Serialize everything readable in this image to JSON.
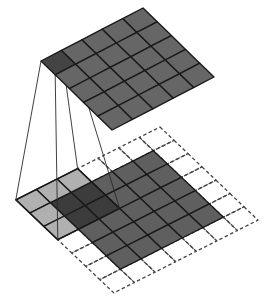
{
  "diagram": {
    "type": "convolution-illustration",
    "colors": {
      "background": "#ffffff",
      "output_cell": "#666666",
      "output_active_cell": "#444444",
      "input_cell": "#5f5f5f",
      "kernel_cell": "#b0b0b0",
      "kernel_overlap_cell": "#3c3c3c",
      "grid_line": "#1a1a1a",
      "padding_dash": "#444444",
      "projection_line": "#2a2a2a"
    },
    "output_grid": {
      "rows": 5,
      "cols": 5,
      "origin": [
        143,
        8
      ],
      "u": [
        14.2,
        13.8
      ],
      "v": [
        -20.4,
        10.6
      ],
      "active_cell": {
        "u": 0,
        "v": 4
      }
    },
    "padded_grid": {
      "rows": 7,
      "cols": 7,
      "origin": [
        160,
        127
      ],
      "u": [
        14.0,
        13.3
      ],
      "v": [
        -20.6,
        10.4
      ],
      "input": {
        "u_start": 1,
        "v_start": 1,
        "size": 5
      },
      "kernel": {
        "u_start": 0,
        "v_start": 4,
        "size": 3
      }
    }
  }
}
